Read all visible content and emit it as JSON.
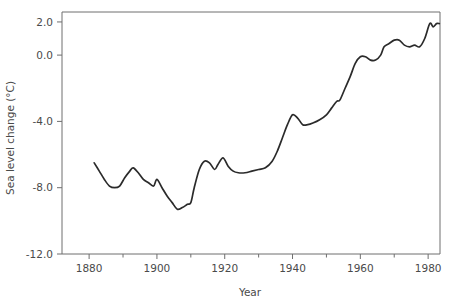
{
  "chart_data": {
    "type": "line",
    "title": "",
    "xlabel": "Year",
    "ylabel": "Sea level change (°C)",
    "xlim": [
      1872,
      1983.5
    ],
    "ylim": [
      -12.0,
      2.6
    ],
    "grid": false,
    "legend": "none",
    "line_color": "#2b2b2b",
    "x_ticks_major": [
      1880,
      1900,
      1920,
      1940,
      1960,
      1980
    ],
    "x_tick_labels": [
      "1880",
      "1900",
      "1920",
      "1940",
      "1960",
      "1980"
    ],
    "x_ticks_minor": [
      1890,
      1910,
      1930,
      1950,
      1970
    ],
    "y_ticks_major": [
      2.0,
      0.0,
      -4.0,
      -8.0,
      -12.0
    ],
    "y_tick_labels": [
      "2.0",
      "0.0",
      "-4.0",
      "-8.0",
      "-12.0"
    ],
    "series": [
      {
        "name": "Sea level change",
        "x": [
          1881.5,
          1883,
          1884.5,
          1886,
          1887.5,
          1889,
          1890.5,
          1892,
          1893,
          1894.5,
          1896,
          1897.5,
          1899,
          1900,
          1901.5,
          1903,
          1904.5,
          1906,
          1907.5,
          1909,
          1910,
          1911,
          1912.5,
          1914,
          1915.5,
          1917,
          1918,
          1919.5,
          1921,
          1922.5,
          1924,
          1926,
          1928,
          1930,
          1932,
          1934,
          1935.5,
          1937,
          1938.5,
          1940,
          1941.5,
          1943,
          1944.5,
          1946,
          1948,
          1950,
          1951.5,
          1953,
          1954,
          1955.5,
          1957,
          1958.5,
          1960,
          1961.5,
          1963,
          1964.5,
          1966,
          1967,
          1968.5,
          1970,
          1971.5,
          1973,
          1974.5,
          1976,
          1977.5,
          1979,
          1980.5,
          1981.5,
          1982.5,
          1983.3
        ],
        "y": [
          -6.5,
          -7.0,
          -7.5,
          -7.9,
          -8.0,
          -7.9,
          -7.4,
          -7.0,
          -6.8,
          -7.1,
          -7.5,
          -7.7,
          -7.9,
          -7.5,
          -8.0,
          -8.5,
          -8.9,
          -9.3,
          -9.2,
          -9.0,
          -8.9,
          -8.0,
          -6.9,
          -6.4,
          -6.5,
          -6.9,
          -6.6,
          -6.2,
          -6.7,
          -7.0,
          -7.1,
          -7.1,
          -7.0,
          -6.9,
          -6.8,
          -6.4,
          -5.8,
          -5.0,
          -4.2,
          -3.6,
          -3.8,
          -4.2,
          -4.2,
          -4.1,
          -3.9,
          -3.6,
          -3.2,
          -2.8,
          -2.7,
          -2.0,
          -1.3,
          -0.5,
          -0.1,
          -0.1,
          -0.3,
          -0.3,
          0.0,
          0.5,
          0.7,
          0.9,
          0.9,
          0.6,
          0.5,
          0.6,
          0.5,
          1.0,
          1.9,
          1.7,
          1.9,
          1.9
        ]
      }
    ]
  },
  "axes": {
    "x_title": "Year",
    "y_title": "Sea level change (°C)"
  }
}
